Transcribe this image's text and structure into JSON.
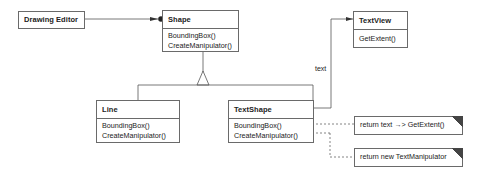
{
  "diagram": {
    "type": "UML class diagram",
    "classes": {
      "drawing_editor": {
        "name": "Drawing Editor",
        "operations": []
      },
      "shape": {
        "name": "Shape",
        "operations": [
          "BoundingBox()",
          "CreateManipulator()"
        ]
      },
      "line": {
        "name": "Line",
        "operations": [
          "BoundingBox()",
          "CreateManipulator()"
        ]
      },
      "text_shape": {
        "name": "TextShape",
        "operations": [
          "BoundingBox()",
          "CreateManipulator()"
        ]
      },
      "text_view": {
        "name": "TextView",
        "operations": [
          "GetExtent()"
        ]
      }
    },
    "associations": {
      "text_label": "text"
    },
    "notes": [
      {
        "text": "return text →> GetExtent()"
      },
      {
        "text": "return new TextManipulator"
      }
    ]
  }
}
